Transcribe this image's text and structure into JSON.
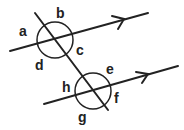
{
  "diagram": {
    "colors": {
      "stroke": "#222222",
      "background": "#ffffff"
    },
    "labels": {
      "a": "a",
      "b": "b",
      "c": "c",
      "d": "d",
      "e": "e",
      "f": "f",
      "g": "g",
      "h": "h"
    },
    "lines": [
      {
        "name": "upper-parallel-line",
        "from": [
          10,
          51
        ],
        "to": [
          148,
          13
        ],
        "arrow": true
      },
      {
        "name": "lower-parallel-line",
        "from": [
          44,
          104
        ],
        "to": [
          178,
          66
        ],
        "arrow": true
      },
      {
        "name": "transversal",
        "from": [
          33,
          12
        ],
        "to": [
          108,
          110
        ]
      }
    ],
    "circles": [
      {
        "name": "upper-intersection-circle",
        "center": [
          55,
          40
        ],
        "r": 18
      },
      {
        "name": "lower-intersection-circle",
        "center": [
          93,
          91
        ],
        "r": 18
      }
    ]
  }
}
